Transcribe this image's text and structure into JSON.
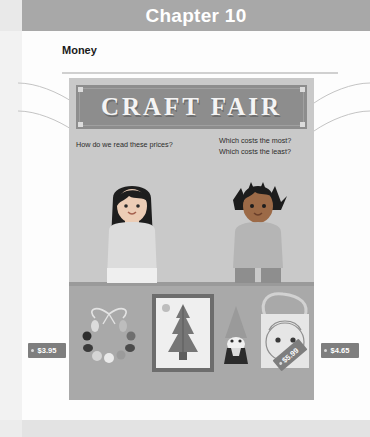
{
  "header": {
    "chapter_title": "Chapter 10",
    "band_color": "#a8a8a8"
  },
  "section": {
    "heading": "Money"
  },
  "illustration": {
    "banner_text": "CRAFT FAIR",
    "banner_color": "#8d8d8d",
    "panel_color": "#c9c9c9",
    "counter_color": "#a9a9a9",
    "questions": {
      "left": "How do we read these prices?",
      "right_line1": "Which costs the most?",
      "right_line2": "Which costs the least?"
    },
    "characters": [
      {
        "name": "girl-with-long-hair",
        "hair_color": "#1e1e1e",
        "shirt_color": "#d6d6d6"
      },
      {
        "name": "boy-with-spiky-hair",
        "hair_color": "#1c1c1c",
        "shirt_color": "#b5b5b5"
      }
    ],
    "items": [
      {
        "name": "beaded-necklace",
        "price": "$3.95"
      },
      {
        "name": "framed-tree-picture",
        "price": "$5.99"
      },
      {
        "name": "gnome-figurine",
        "price": "$2.50"
      },
      {
        "name": "tote-bag-with-face",
        "price": "$4.65"
      }
    ],
    "price_tags": {
      "necklace": "$3.95",
      "picture": "$5.99",
      "gnome": "$2.50",
      "tote": "$4.65",
      "tag_color": "#7e7e7e"
    }
  },
  "footer": {
    "band_color": "#e3e3e3",
    "mark": ""
  }
}
